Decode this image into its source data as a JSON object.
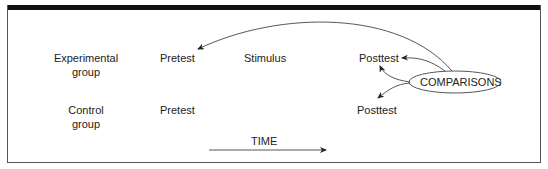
{
  "diagram": {
    "rows": [
      {
        "group_line1": "Experimental",
        "group_line2": "group",
        "pretest": "Pretest",
        "stimulus": "Stimulus",
        "posttest": "Posttest"
      },
      {
        "group_line1": "Control",
        "group_line2": "group",
        "pretest": "Pretest",
        "posttest": "Posttest"
      }
    ],
    "comparisons_label": "COMPARISONS",
    "time_label": "TIME",
    "colors": {
      "frame_bar": "#111111",
      "line": "#333333",
      "text": "#222222"
    }
  }
}
